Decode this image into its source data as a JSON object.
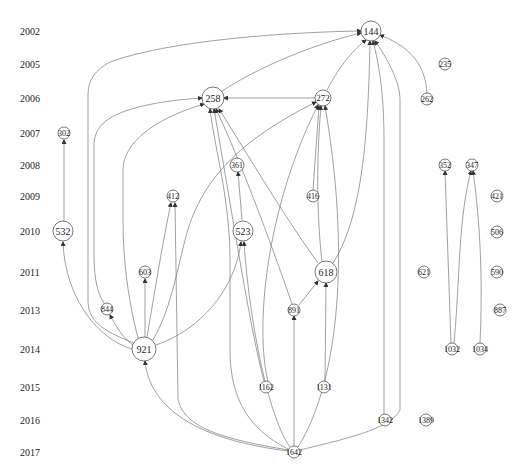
{
  "caption": "",
  "years": [
    {
      "label": "2002",
      "y": 31
    },
    {
      "label": "2005",
      "y": 64
    },
    {
      "label": "2006",
      "y": 98
    },
    {
      "label": "2007",
      "y": 133
    },
    {
      "label": "2008",
      "y": 165
    },
    {
      "label": "2009",
      "y": 196
    },
    {
      "label": "2010",
      "y": 231
    },
    {
      "label": "2011",
      "y": 272
    },
    {
      "label": "2013",
      "y": 310
    },
    {
      "label": "2014",
      "y": 349
    },
    {
      "label": "2015",
      "y": 387
    },
    {
      "label": "2016",
      "y": 420
    },
    {
      "label": "2017",
      "y": 452
    }
  ],
  "nodes": [
    {
      "id": "144",
      "x": 371,
      "y": 31,
      "r": 10,
      "fs": 10
    },
    {
      "id": "235",
      "x": 445,
      "y": 64,
      "r": 6,
      "fs": 8
    },
    {
      "id": "258",
      "x": 213,
      "y": 98,
      "r": 11,
      "fs": 10
    },
    {
      "id": "272",
      "x": 323,
      "y": 98,
      "r": 8,
      "fs": 9
    },
    {
      "id": "262",
      "x": 427,
      "y": 99,
      "r": 6,
      "fs": 8
    },
    {
      "id": "302",
      "x": 64,
      "y": 133,
      "r": 6,
      "fs": 8
    },
    {
      "id": "361",
      "x": 237,
      "y": 165,
      "r": 7,
      "fs": 8
    },
    {
      "id": "352",
      "x": 445,
      "y": 165,
      "r": 6,
      "fs": 8
    },
    {
      "id": "347",
      "x": 472,
      "y": 165,
      "r": 6,
      "fs": 8
    },
    {
      "id": "412",
      "x": 173,
      "y": 196,
      "r": 6,
      "fs": 8
    },
    {
      "id": "416",
      "x": 313,
      "y": 196,
      "r": 6,
      "fs": 8
    },
    {
      "id": "421",
      "x": 497,
      "y": 196,
      "r": 6,
      "fs": 8
    },
    {
      "id": "532",
      "x": 63,
      "y": 231,
      "r": 10,
      "fs": 10
    },
    {
      "id": "523",
      "x": 243,
      "y": 231,
      "r": 10,
      "fs": 10
    },
    {
      "id": "506",
      "x": 497,
      "y": 232,
      "r": 6,
      "fs": 8
    },
    {
      "id": "603",
      "x": 145,
      "y": 272,
      "r": 6,
      "fs": 8
    },
    {
      "id": "618",
      "x": 326,
      "y": 272,
      "r": 11,
      "fs": 10
    },
    {
      "id": "621",
      "x": 424,
      "y": 272,
      "r": 6,
      "fs": 8
    },
    {
      "id": "590",
      "x": 497,
      "y": 272,
      "r": 6,
      "fs": 8
    },
    {
      "id": "844",
      "x": 107,
      "y": 309,
      "r": 6,
      "fs": 8
    },
    {
      "id": "891",
      "x": 294,
      "y": 310,
      "r": 6,
      "fs": 8
    },
    {
      "id": "887",
      "x": 500,
      "y": 310,
      "r": 6,
      "fs": 8
    },
    {
      "id": "921",
      "x": 144,
      "y": 349,
      "r": 12,
      "fs": 10
    },
    {
      "id": "1032",
      "x": 452,
      "y": 349,
      "r": 6,
      "fs": 8
    },
    {
      "id": "1034",
      "x": 480,
      "y": 349,
      "r": 6,
      "fs": 8
    },
    {
      "id": "1162",
      "x": 266,
      "y": 387,
      "r": 6,
      "fs": 8
    },
    {
      "id": "1131",
      "x": 324,
      "y": 387,
      "r": 6,
      "fs": 8
    },
    {
      "id": "1342",
      "x": 385,
      "y": 420,
      "r": 6,
      "fs": 8
    },
    {
      "id": "1389",
      "x": 426,
      "y": 420,
      "r": 6,
      "fs": 8
    },
    {
      "id": "1642",
      "x": 294,
      "y": 452,
      "r": 6,
      "fs": 8
    }
  ],
  "edges": [
    {
      "from": "258",
      "to": "144",
      "d": "M222,91 C270,60 330,40 361,33"
    },
    {
      "from": "272",
      "to": "144",
      "d": "M327,90 C340,65 355,48 366,40"
    },
    {
      "from": "272",
      "to": "258",
      "d": "M315,98 L224,98"
    },
    {
      "from": "262",
      "to": "144",
      "d": "M427,93 C425,60 405,45 380,35"
    },
    {
      "from": "921",
      "to": "144",
      "d": "M134,343 C100,330 88,320 88,300 L88,95 C88,80 95,70 110,62 C170,40 290,32 361,31"
    },
    {
      "from": "844",
      "to": "258",
      "d": "M104,303 C95,290 94,270 94,250 L94,145 C94,125 110,115 135,108 C165,100 190,99 202,98"
    },
    {
      "from": "921",
      "to": "258",
      "d": "M138,338 C128,300 123,260 123,220 L123,170 C123,145 150,120 204,104"
    },
    {
      "from": "921",
      "to": "272",
      "d": "M153,340 C170,310 175,280 185,240 C200,180 240,140 316,102"
    },
    {
      "from": "921",
      "to": "412",
      "d": "M147,337 C155,290 163,240 171,203"
    },
    {
      "from": "921",
      "to": "603",
      "d": "M145,337 L145,279"
    },
    {
      "from": "921",
      "to": "844",
      "d": "M133,345 C123,338 115,325 110,315"
    },
    {
      "from": "921",
      "to": "532",
      "d": "M132,349 C100,340 65,300 63,242"
    },
    {
      "from": "921",
      "to": "523",
      "d": "M156,345 C200,330 235,290 241,242"
    },
    {
      "from": "302",
      "to": "302src",
      "d": "M64,231 L64,140"
    },
    {
      "from": "523",
      "to": "361",
      "d": "M242,220 L238,172"
    },
    {
      "from": "618",
      "to": "258",
      "d": "M318,263 C280,210 245,150 219,109"
    },
    {
      "from": "618",
      "to": "272",
      "d": "M322,262 C315,200 318,140 321,106"
    },
    {
      "from": "618",
      "to": "144",
      "d": "M333,263 C360,220 368,150 370,41"
    },
    {
      "from": "891",
      "to": "618",
      "d": "M299,305 L318,281"
    },
    {
      "from": "891",
      "to": "258",
      "d": "M292,304 C270,240 240,160 216,109"
    },
    {
      "from": "416",
      "to": "272",
      "d": "M313,190 L319,106"
    },
    {
      "from": "1131",
      "to": "618",
      "d": "M325,381 L326,283"
    },
    {
      "from": "1162",
      "to": "272",
      "d": "M268,381 C255,330 265,210 318,105"
    },
    {
      "from": "1162",
      "to": "258",
      "d": "M264,381 C250,330 230,200 214,109"
    },
    {
      "from": "1642",
      "to": "891",
      "d": "M294,446 L294,316"
    },
    {
      "from": "1642",
      "to": "921",
      "d": "M288,451 C200,440 150,410 145,361"
    },
    {
      "from": "1642",
      "to": "412",
      "d": "M288,450 C230,440 185,430 178,400 L175,203"
    },
    {
      "from": "1642",
      "to": "258",
      "d": "M288,449 C250,430 230,400 230,350 L230,260 C230,200 215,150 210,109"
    },
    {
      "from": "1642",
      "to": "523",
      "d": "M290,447 C270,420 250,330 244,242"
    },
    {
      "from": "1642",
      "to": "272",
      "d": "M298,447 C340,380 350,250 325,106"
    },
    {
      "from": "1642",
      "to": "144",
      "d": "M300,450 C340,440 390,430 400,410 L400,100 C400,80 385,55 375,41"
    },
    {
      "from": "1342",
      "to": "144",
      "d": "M384,414 L384,140 C384,90 378,60 373,41"
    },
    {
      "from": "1032",
      "to": "352",
      "d": "M451,343 L445,171"
    },
    {
      "from": "1032",
      "to": "347",
      "d": "M454,343 C460,280 458,220 471,171"
    },
    {
      "from": "1034",
      "to": "347",
      "d": "M480,343 C483,280 480,220 473,171"
    }
  ]
}
